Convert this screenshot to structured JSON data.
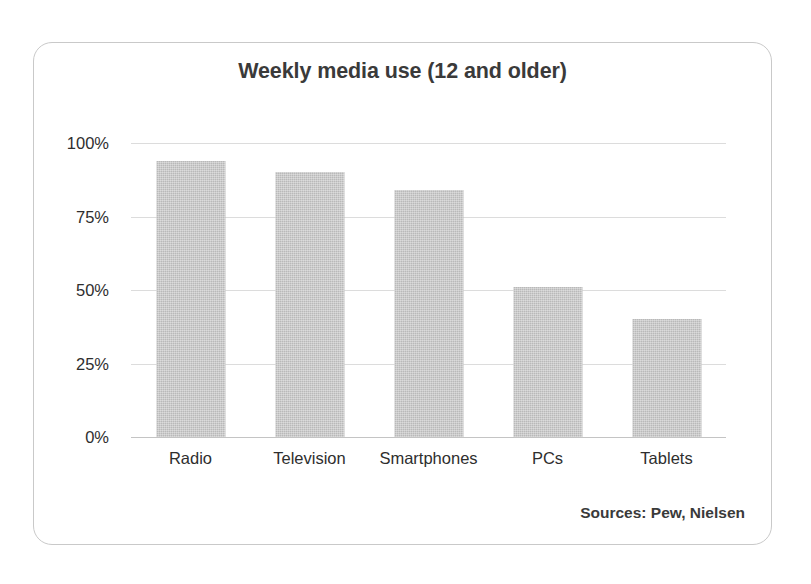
{
  "chart_data": {
    "type": "bar",
    "title": "Weekly media use (12 and older)",
    "xlabel": "",
    "ylabel": "",
    "categories": [
      "Radio",
      "Television",
      "Smartphones",
      "PCs",
      "Tablets"
    ],
    "values": [
      94,
      90,
      84,
      51,
      40
    ],
    "value_unit": "%",
    "ylim": [
      0,
      100
    ],
    "yticks": [
      0,
      25,
      50,
      75,
      100
    ],
    "ytick_labels": [
      "0%",
      "25%",
      "50%",
      "75%",
      "100%"
    ],
    "grid": true,
    "legend": false,
    "legend_position": "none",
    "series": [
      {
        "name": "Weekly media use",
        "values": [
          94,
          90,
          84,
          51,
          40
        ]
      }
    ],
    "annotations": [
      "Sources: Pew, Nielsen"
    ],
    "colors": {
      "bar_fill": "#b9b9b9",
      "gridline": "#dcdcdc",
      "axis": "#c4c4c4",
      "text": "#2e2e2e",
      "title_text": "#3a3a3a",
      "card_border": "#c9c9c9",
      "background": "#ffffff"
    }
  },
  "footer": {
    "source_note": "Sources: Pew, Nielsen"
  }
}
